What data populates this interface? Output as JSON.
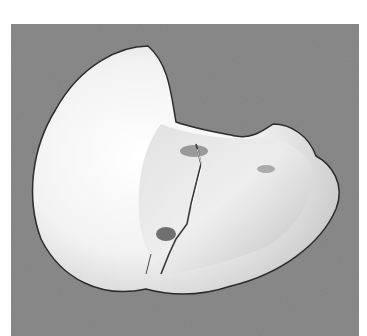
{
  "image": {
    "subject": "tooth crown with crack line, occlusal view",
    "alt": "Grayscale photograph of an extracted tooth crown showing a crack running across its surface, on a gray textured background",
    "colors": {
      "background": "#8b8b8b",
      "tooth": "#f4f4f4",
      "shadow": "#b5b5b5",
      "crack": "#3a3a3a"
    }
  }
}
